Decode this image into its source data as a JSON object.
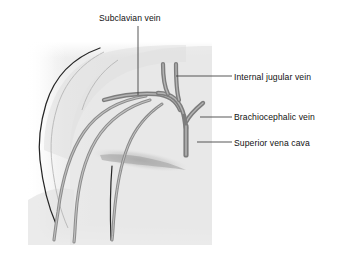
{
  "figure": {
    "background_color": "#ffffff",
    "body_fill_color": "#e9e9e9",
    "vein_color": "#7d7d7d",
    "vein_highlight_color": "#a8a8a8",
    "outline_color": "#262626",
    "leader_line_color": "#3a3a3a",
    "text_color": "#111111"
  },
  "labels": {
    "subclavian_vein": "Subclavian vein",
    "internal_jugular_vein": "Internal jugular vein",
    "brachiocephalic_vein": "Brachiocephalic vein",
    "superior_vena_cava": "Superior vena cava"
  },
  "structures": [
    {
      "name": "subclavian-vein",
      "label": "Subclavian vein",
      "leader": {
        "type": "vertical",
        "x": 138,
        "y_start": 26,
        "y_end": 95
      }
    },
    {
      "name": "internal-jugular-vein",
      "label": "Internal jugular vein",
      "leader": {
        "type": "horizontal",
        "y": 76,
        "x_start": 176,
        "x_end": 232
      }
    },
    {
      "name": "brachiocephalic-vein",
      "label": "Brachiocephalic vein",
      "leader": {
        "type": "horizontal",
        "y": 117,
        "x_start": 200,
        "x_end": 232
      }
    },
    {
      "name": "superior-vena-cava",
      "label": "Superior vena cava",
      "leader": {
        "type": "horizontal",
        "y": 142,
        "x_start": 197,
        "x_end": 232
      }
    }
  ]
}
